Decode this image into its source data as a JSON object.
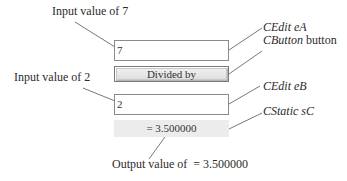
{
  "diagram": {
    "widgets": {
      "edit_a": {
        "value": "7"
      },
      "button": {
        "label": "Divided by"
      },
      "edit_b": {
        "value": "2"
      },
      "static_c": {
        "text": "= 3.500000"
      }
    },
    "annotations": {
      "input_a": "Input value of 7",
      "input_b": "Input value of 2",
      "output": "Output value of  = 3.500000",
      "edit_a_class": "CEdit",
      "edit_a_name": "eA",
      "button_class": "CButton",
      "button_name": "button",
      "edit_b_class": "CEdit",
      "edit_b_name": "eB",
      "static_c_class": "CStatic",
      "static_c_name": "sC"
    }
  }
}
